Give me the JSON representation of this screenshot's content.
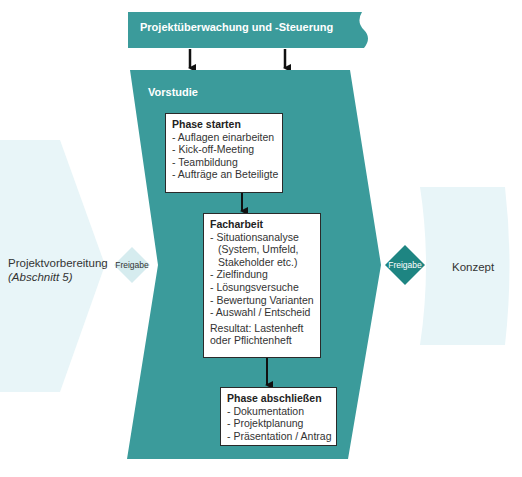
{
  "colors": {
    "teal": "#3b9b9b",
    "teal_dark": "#1e8582",
    "light_fill": "#e8f5f8",
    "gate_light": "#d6ecef",
    "arrow": "#111111"
  },
  "banner": {
    "title": "Projektüberwachung und -Steuerung"
  },
  "phase": {
    "title": "Vorstudie"
  },
  "boxes": [
    {
      "title": "Phase starten",
      "items": [
        "- Auflagen einarbeiten",
        "- Kick-off-Meeting",
        "- Teambildung",
        "- Aufträge an Beteiligte"
      ]
    },
    {
      "title": "Facharbeit",
      "items": [
        "- Situationsanalyse",
        "(System, Umfeld,",
        "Stakeholder etc.)",
        "- Zielfindung",
        "- Lösungsversuche",
        "- Bewertung Varianten",
        "- Auswahl / Entscheid"
      ],
      "result_line1": "Resultat: Lastenheft",
      "result_line2": "oder Pflichtenheft"
    },
    {
      "title": "Phase abschließen",
      "items": [
        "- Dokumentation",
        "- Projektplanung",
        "- Präsentation / Antrag"
      ]
    }
  ],
  "previous_phase": {
    "label": "Projektvorbereitung",
    "sublabel": "(Abschnitt 5)"
  },
  "next_phase": {
    "label": "Konzept"
  },
  "gates": {
    "left": "Freigabe",
    "right": "Freigabe"
  }
}
